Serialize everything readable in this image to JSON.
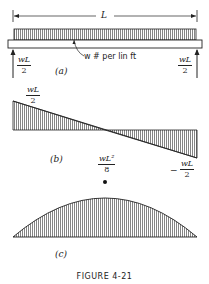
{
  "figure": {
    "caption": "FIGURE 4-21",
    "part_a": {
      "label": "(a)",
      "span_label": "L",
      "load_label": "w # per lin ft",
      "left_reaction": {
        "num": "wL",
        "den": "2"
      },
      "right_reaction": {
        "num": "wL",
        "den": "2"
      }
    },
    "part_b": {
      "label": "(b)",
      "left_value": {
        "num": "wL",
        "den": "2"
      },
      "right_value": {
        "sign": "−",
        "num": "wL",
        "den": "2"
      }
    },
    "part_c": {
      "label": "(c)",
      "peak_value": {
        "num": "wL²",
        "den": "8"
      }
    }
  }
}
